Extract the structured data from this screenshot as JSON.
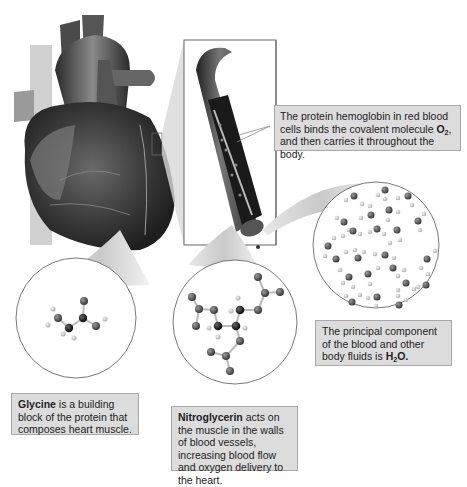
{
  "figure": {
    "colors": {
      "callout_fill": "#dcdcdc",
      "callout_border": "#a8a8a8",
      "atom_carbon": "#111111",
      "atom_oxygen": "#555555",
      "atom_hydrogen": "#c8c8c8"
    }
  },
  "callouts": {
    "hemoglobin": {
      "pre": "The protein hemoglobin in red blood cells binds the covalent molecule ",
      "bold": "O",
      "bold_sub": "2",
      "post": ", and then carries it throughout the body."
    },
    "water": {
      "pre": "The principal component of the blood and other body fluids is ",
      "bold": "H",
      "bold_sub": "2",
      "bold_post": "O."
    },
    "glycine": {
      "bold": "Glycine",
      "post": " is a building block of the protein that composes heart muscle."
    },
    "nitroglycerin": {
      "bold": "Nitroglycerin",
      "post": " acts on the muscle in the walls of blood vessels, increasing blood flow and oxygen delivery to the heart."
    }
  },
  "illustrations": {
    "heart": "heart-illustration",
    "vessel": "blood-vessel-cutaway",
    "circles": [
      "glycine-molecule",
      "nitroglycerin-molecule",
      "water-molecules"
    ]
  }
}
